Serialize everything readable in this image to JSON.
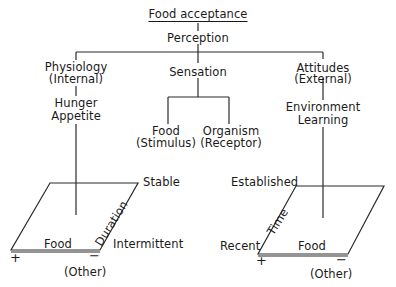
{
  "title": "Food acceptance",
  "root": "Perception",
  "branches": {
    "left": {
      "label": "Physiology",
      "sub": "(Internal)",
      "factors": [
        "Hunger",
        "Appetite"
      ],
      "plane": {
        "axis_label": "Duration",
        "top_label": "Stable",
        "bottom_label": "Intermittent",
        "food_label": "Food",
        "plus": "+",
        "minus": "−",
        "other_label": "(Other)"
      }
    },
    "center": {
      "label": "Sensation",
      "children": [
        {
          "label": "Food",
          "sub": "(Stimulus)"
        },
        {
          "label": "Organism",
          "sub": "(Receptor)"
        }
      ]
    },
    "right": {
      "label": "Attitudes",
      "sub": "(External)",
      "factors": [
        "Environment",
        "Learning"
      ],
      "plane": {
        "axis_label": "Time",
        "top_label": "Established",
        "bottom_label": "Recent",
        "food_label": "Food",
        "plus": "+",
        "minus": "−",
        "other_label": "(Other)"
      }
    }
  },
  "colors": {
    "line": "#2a2a2a",
    "text": "#1a1a1a",
    "background": "#ffffff"
  }
}
